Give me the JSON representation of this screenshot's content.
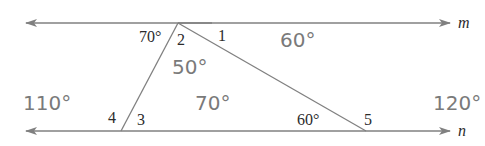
{
  "figure": {
    "lines": {
      "m": {
        "label": "m"
      },
      "n": {
        "label": "n"
      }
    },
    "numbered_angles": {
      "a1": "1",
      "a2": "2",
      "a3": "3",
      "a4": "4",
      "a5": "5"
    },
    "given_angles": {
      "top_left": "70°",
      "bottom_right_interior": "60°"
    },
    "answer_angles": {
      "angle1": "60°",
      "angle2": "50°",
      "angle3": "70°",
      "angle4": "110°",
      "angle5": "120°"
    },
    "colors": {
      "line": "#808080",
      "label_text": "#2b2b2b",
      "answer_text": "#7a7a7a"
    }
  }
}
